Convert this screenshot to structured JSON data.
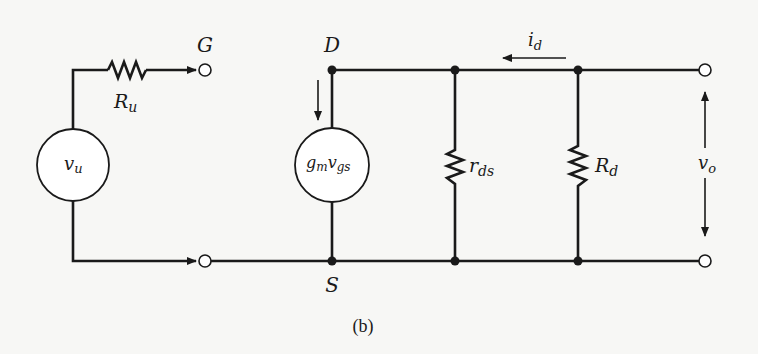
{
  "figure": {
    "caption": "(b)"
  },
  "labels": {
    "gate_terminal": "G",
    "drain_node": "D",
    "source_node": "S",
    "input_resistor": {
      "main": "R",
      "sub": "u"
    },
    "input_source": {
      "main": "v",
      "sub": "u"
    },
    "dependent_source": {
      "g": "g",
      "g_sub": "m",
      "v": "v",
      "v_sub": "gs"
    },
    "drain_resistance": {
      "main": "r",
      "sub": "ds"
    },
    "load_resistor": {
      "main": "R",
      "sub": "d"
    },
    "drain_current": {
      "main": "i",
      "sub": "d"
    },
    "output_voltage": {
      "main": "v",
      "sub": "o"
    }
  },
  "colors": {
    "ink": "#1a1a1a",
    "paper": "#f7f7f5"
  }
}
